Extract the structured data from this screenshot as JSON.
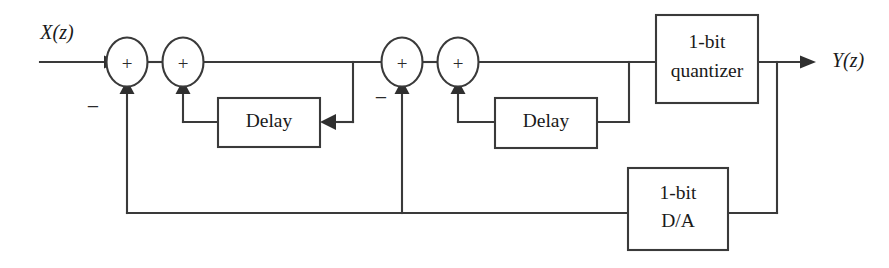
{
  "diagram": {
    "background_color": "#ffffff",
    "line_color": "#3a3a3a",
    "text_color": "#1a1a1a",
    "signals": {
      "input_label": "X(z)",
      "output_label": "Y(z)"
    },
    "blocks": [
      {
        "id": "delay1",
        "label": "Delay"
      },
      {
        "id": "delay2",
        "label": "Delay"
      },
      {
        "id": "quantizer",
        "label_line1": "1-bit",
        "label_line2": "quantizer"
      },
      {
        "id": "dac",
        "label_line1": "1-bit",
        "label_line2": "D/A"
      }
    ],
    "summers": [
      {
        "id": "sum1",
        "plus": "+",
        "side_sign": "−"
      },
      {
        "id": "sum2",
        "plus": "+",
        "side_sign": ""
      },
      {
        "id": "sum3",
        "plus": "+",
        "side_sign": "−"
      },
      {
        "id": "sum4",
        "plus": "+",
        "side_sign": ""
      }
    ]
  }
}
